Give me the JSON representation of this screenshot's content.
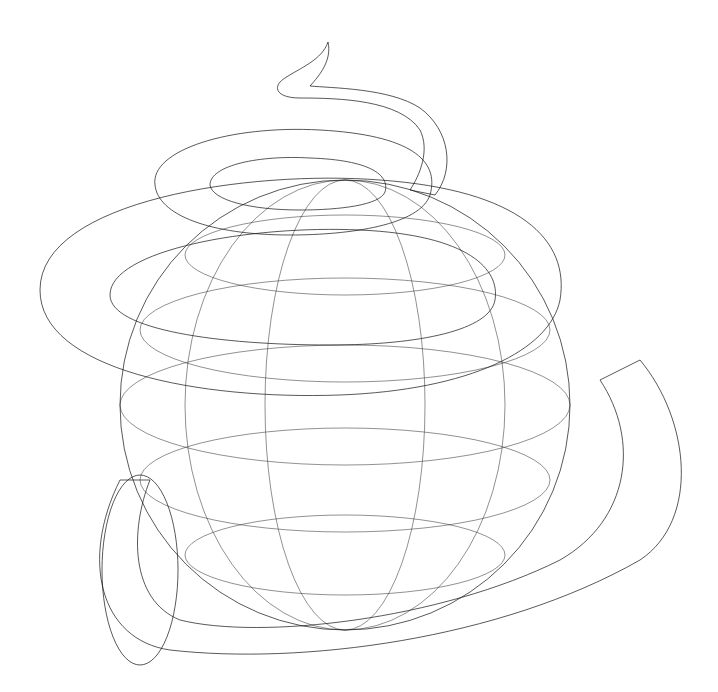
{
  "image": {
    "description": "Black-and-white 3D wireframe render of a sphere wrapped by a spiraling tube (torus-like helix) that tapers to a thin horn tip at the top",
    "background": "#ffffff",
    "line_color": "#111111",
    "objects": [
      {
        "name": "sphere",
        "center": [
          345,
          400
        ],
        "radius": 225
      },
      {
        "name": "helix-tube",
        "coils": 3,
        "tip": [
          328,
          42
        ]
      },
      {
        "name": "base-tube-end",
        "center": [
          150,
          570
        ]
      }
    ]
  }
}
